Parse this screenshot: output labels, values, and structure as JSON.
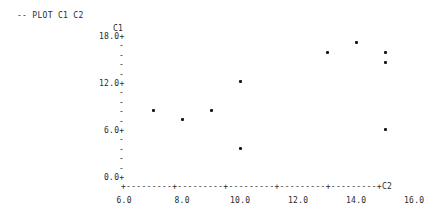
{
  "header": {
    "command": "-- PLOT C1 C2"
  },
  "chart_data": {
    "type": "scatter",
    "title": "PLOT C1 C2",
    "xlabel": "C2",
    "ylabel": "C1",
    "x_ticks": [
      "6.0",
      "8.0",
      "10.0",
      "12.0",
      "14.0",
      "16.0"
    ],
    "y_ticks": [
      "18.0",
      "12.0",
      "6.0",
      "0.0"
    ],
    "xlim": [
      6.0,
      16.0
    ],
    "ylim": [
      0.0,
      18.0
    ],
    "grid": false,
    "points": [
      {
        "x": 7.0,
        "y": 8.7
      },
      {
        "x": 8.0,
        "y": 7.5
      },
      {
        "x": 9.0,
        "y": 8.7
      },
      {
        "x": 10.0,
        "y": 12.4
      },
      {
        "x": 10.0,
        "y": 3.8
      },
      {
        "x": 13.0,
        "y": 16.1
      },
      {
        "x": 14.0,
        "y": 17.4
      },
      {
        "x": 15.0,
        "y": 16.1
      },
      {
        "x": 15.0,
        "y": 14.8
      },
      {
        "x": 15.0,
        "y": 6.3
      }
    ]
  }
}
